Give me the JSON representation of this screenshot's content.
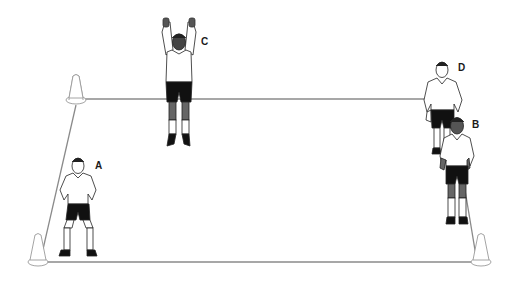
{
  "diagram": {
    "type": "training-drill-illustration",
    "field": {
      "shape": "trapezoid",
      "line_color": "#8a8a8a",
      "corners": {
        "top_left": [
          76,
          99
        ],
        "top_right": [
          458,
          99
        ],
        "bottom_left": [
          40,
          262
        ],
        "bottom_right": [
          478,
          262
        ]
      }
    },
    "cones": [
      {
        "id": "cone-top-left",
        "x": 76,
        "y": 103
      },
      {
        "id": "cone-bottom-left",
        "x": 38,
        "y": 265
      },
      {
        "id": "cone-bottom-right",
        "x": 481,
        "y": 265
      }
    ],
    "players": [
      {
        "id": "A",
        "label": "A",
        "pose": "crouched-ready",
        "skin": "#ffffff",
        "x": 78,
        "y": 155
      },
      {
        "id": "B",
        "label": "B",
        "pose": "standing",
        "skin": "#555555",
        "x": 458,
        "y": 115
      },
      {
        "id": "C",
        "label": "C",
        "pose": "jumping-arms-up",
        "skin": "#444444",
        "x": 178,
        "y": 18
      },
      {
        "id": "D",
        "label": "D",
        "pose": "standing",
        "skin": "#ffffff",
        "x": 443,
        "y": 60
      }
    ],
    "colors": {
      "shirt": "#ffffff",
      "shorts": "#111111",
      "outline": "#222222",
      "boots": "#111111"
    }
  }
}
